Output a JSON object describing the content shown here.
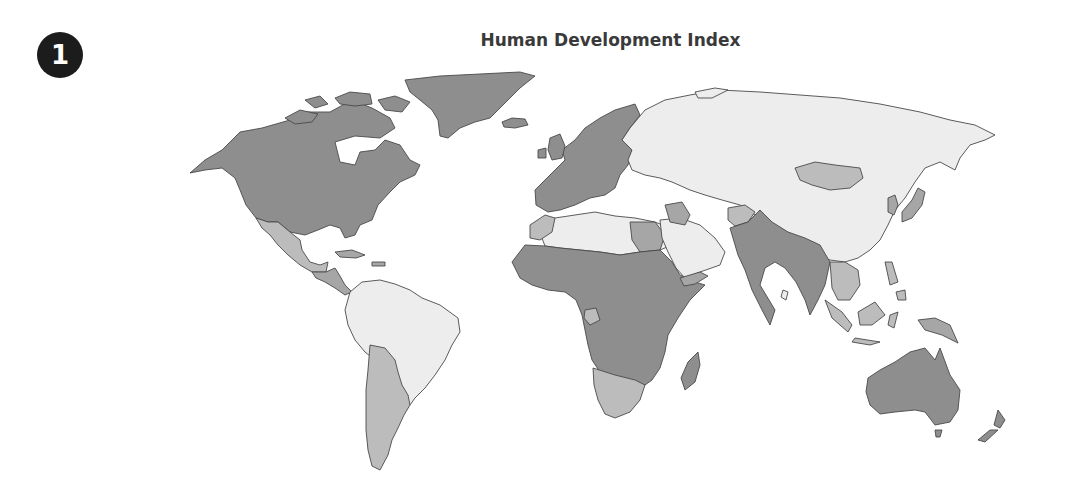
{
  "figure": {
    "number_badge": "1",
    "title": "Human Development Index"
  },
  "tiers": {
    "very_high": "#8e8e8e",
    "high": "#a6a6a6",
    "medium": "#bcbcbc",
    "low": "#ededed"
  },
  "map_data": {
    "type": "choropleth",
    "title": "Human Development Index",
    "legend": "none shown",
    "regions": [
      {
        "name": "Alaska / USA / Canada",
        "tier": "very_high"
      },
      {
        "name": "Greenland",
        "tier": "very_high"
      },
      {
        "name": "Iceland",
        "tier": "very_high"
      },
      {
        "name": "Mexico",
        "tier": "medium"
      },
      {
        "name": "Central America",
        "tier": "high"
      },
      {
        "name": "Northern South America / Brazil / Peru",
        "tier": "low"
      },
      {
        "name": "Argentina / Chile / Bolivia",
        "tier": "medium"
      },
      {
        "name": "Western Europe",
        "tier": "very_high"
      },
      {
        "name": "Eastern Europe",
        "tier": "low"
      },
      {
        "name": "Russia",
        "tier": "low"
      },
      {
        "name": "Central Asia",
        "tier": "low"
      },
      {
        "name": "Mongolia",
        "tier": "medium"
      },
      {
        "name": "China",
        "tier": "low"
      },
      {
        "name": "Japan / Korea",
        "tier": "high"
      },
      {
        "name": "North Africa",
        "tier": "low"
      },
      {
        "name": "Sub-Saharan Africa",
        "tier": "very_high"
      },
      {
        "name": "Southern Africa",
        "tier": "medium"
      },
      {
        "name": "Madagascar",
        "tier": "very_high"
      },
      {
        "name": "Arabian Peninsula",
        "tier": "low"
      },
      {
        "name": "Iraq / Iran west",
        "tier": "high"
      },
      {
        "name": "Afghanistan",
        "tier": "medium"
      },
      {
        "name": "Pakistan / India / Myanmar",
        "tier": "very_high"
      },
      {
        "name": "Southeast Asia mainland",
        "tier": "medium"
      },
      {
        "name": "Indonesia / Borneo",
        "tier": "medium"
      },
      {
        "name": "Papua New Guinea",
        "tier": "high"
      },
      {
        "name": "Australia",
        "tier": "very_high"
      },
      {
        "name": "New Zealand",
        "tier": "very_high"
      }
    ]
  }
}
